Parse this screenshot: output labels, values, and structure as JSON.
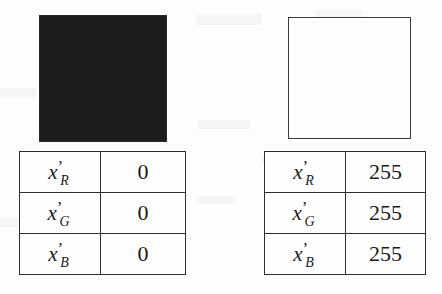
{
  "figure": {
    "name": "rgb-component-values-figure",
    "background_color": "#fdfdfd",
    "ink_color": "#1a1a1a"
  },
  "panels": [
    {
      "id": "black",
      "swatch": {
        "name": "black-color-swatch",
        "fill_color": "#1d1c1a",
        "description": "solid black square"
      },
      "table": {
        "name": "black-rgb-table",
        "rows": [
          {
            "label_base": "x",
            "label_prime": "’",
            "label_sub": "R",
            "value": "0"
          },
          {
            "label_base": "x",
            "label_prime": "’",
            "label_sub": "G",
            "value": "0"
          },
          {
            "label_base": "x",
            "label_prime": "’",
            "label_sub": "B",
            "value": "0"
          }
        ]
      }
    },
    {
      "id": "white",
      "swatch": {
        "name": "white-color-swatch",
        "fill_color": "#fefefe",
        "border_color": "#3b3b3b",
        "description": "outlined white square"
      },
      "table": {
        "name": "white-rgb-table",
        "rows": [
          {
            "label_base": "x",
            "label_prime": "’",
            "label_sub": "R",
            "value": "255"
          },
          {
            "label_base": "x",
            "label_prime": "’",
            "label_sub": "G",
            "value": "255"
          },
          {
            "label_base": "x",
            "label_prime": "’",
            "label_sub": "B",
            "value": "255"
          }
        ]
      }
    }
  ]
}
